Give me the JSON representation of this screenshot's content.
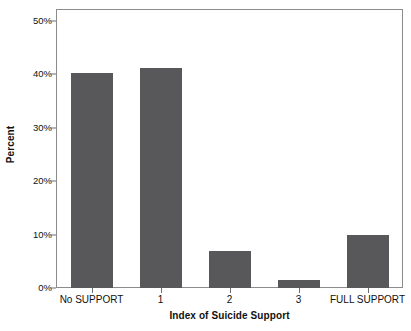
{
  "chart_data": {
    "type": "bar",
    "title": "",
    "xlabel": "Index of Suicide Support",
    "ylabel": "Percent",
    "categories": [
      "No SUPPORT",
      "1",
      "2",
      "3",
      "FULL SUPPORT"
    ],
    "values": [
      40.3,
      41.2,
      7.0,
      1.5,
      10.0
    ],
    "ylim": [
      0,
      50
    ],
    "ytick_values": [
      0,
      10,
      20,
      30,
      40,
      50
    ],
    "ytick_labels": [
      "0%",
      "10%",
      "20%",
      "30%",
      "40%",
      "50%"
    ],
    "grid": false,
    "legend": null,
    "bar_color": "#58585a",
    "frame_color": "#8c8c8e",
    "text_color": "#111111"
  }
}
